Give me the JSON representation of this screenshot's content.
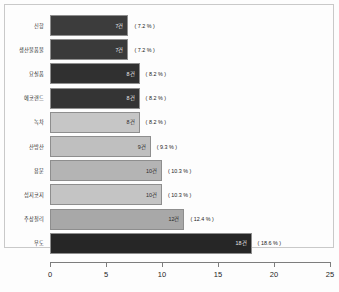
{
  "chart_data": {
    "type": "bar",
    "orientation": "horizontal",
    "title": "",
    "xlabel": "",
    "ylabel": "",
    "xlim": [
      0,
      25
    ],
    "xticks": [
      0,
      5,
      10,
      15,
      20,
      25
    ],
    "grid": false,
    "legend": "none",
    "categories": [
      "신항",
      "생산물품물",
      "요실품",
      "에코랜드",
      "녹차",
      "산방산",
      "용문",
      "섭지코지",
      "주상절리",
      "우도"
    ],
    "values": [
      7,
      7,
      8,
      8,
      8,
      9,
      10,
      10,
      12,
      18
    ],
    "percents": [
      7.2,
      7.2,
      8.2,
      8.2,
      8.2,
      9.3,
      10.3,
      10.3,
      12.4,
      18.6
    ],
    "value_labels": [
      "7건",
      "7건",
      "8건",
      "8건",
      "8건",
      "9건",
      "10건",
      "10건",
      "12건",
      "18건"
    ],
    "percent_labels": [
      "( 7.2 % )",
      "( 7.2 % )",
      "( 8.2 % )",
      "( 8.2 % )",
      "( 8.2 % )",
      "( 9.3 % )",
      "( 10.3 % )",
      "( 10.3 % )",
      "( 12.4 % )",
      "( 18.6 % )"
    ],
    "bar_colors": [
      "#3c3c3c",
      "#3a3a3a",
      "#303030",
      "#343434",
      "#c6c6c6",
      "#bfbfbf",
      "#b4b4b4",
      "#c4c4c4",
      "#a8a8a8",
      "#262626"
    ],
    "value_label_colors": [
      "#e8e8e8",
      "#e8e8e8",
      "#e8e8e8",
      "#e8e8e8",
      "#2a2a2a",
      "#2a2a2a",
      "#2a2a2a",
      "#2a2a2a",
      "#2a2a2a",
      "#e8e8e8"
    ],
    "tick_labels": [
      "0",
      "5",
      "10",
      "15",
      "20",
      "25"
    ],
    "axis_color": "#7d7d7d",
    "frame_color": "#c9c9c9",
    "background": "#fdfdfd"
  }
}
